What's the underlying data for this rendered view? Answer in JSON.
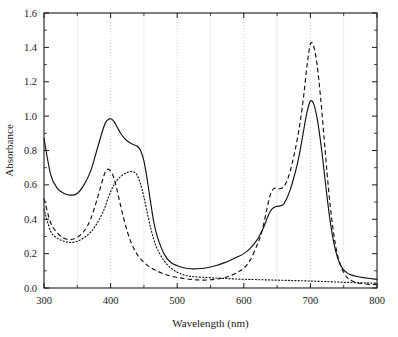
{
  "chart_data": {
    "type": "line",
    "title": "",
    "xlabel": "Wavelength (nm)",
    "ylabel": "Absorbance",
    "xlim": [
      300,
      800
    ],
    "ylim": [
      0.0,
      1.6
    ],
    "xticks": [
      300,
      400,
      500,
      600,
      700,
      800
    ],
    "xtick_labels": [
      "300",
      "400",
      "500",
      "600",
      "700",
      "800"
    ],
    "xminor_ticks": [
      350,
      450,
      550,
      650,
      750
    ],
    "yticks": [
      0.0,
      0.2,
      0.4,
      0.6,
      0.8,
      1.0,
      1.2,
      1.4,
      1.6
    ],
    "ytick_labels": [
      "0.0",
      "0.2",
      "0.4",
      "0.6",
      "0.8",
      "1.0",
      "1.2",
      "1.4",
      "1.6"
    ],
    "yminor_ticks": [
      0.1,
      0.3,
      0.5,
      0.7,
      0.9,
      1.1,
      1.3,
      1.5
    ],
    "grid": "vertical-only",
    "legend": "none",
    "x": [
      300,
      310,
      320,
      330,
      340,
      350,
      360,
      370,
      380,
      390,
      395,
      400,
      405,
      410,
      415,
      420,
      425,
      430,
      435,
      440,
      445,
      450,
      455,
      460,
      465,
      470,
      480,
      490,
      500,
      510,
      520,
      530,
      540,
      550,
      560,
      570,
      580,
      590,
      600,
      610,
      620,
      625,
      630,
      635,
      640,
      645,
      650,
      655,
      660,
      665,
      670,
      675,
      680,
      685,
      690,
      695,
      700,
      705,
      710,
      715,
      720,
      725,
      730,
      735,
      740,
      745,
      750,
      755,
      760,
      770,
      780,
      790,
      800
    ],
    "series": [
      {
        "name": "solid-curve",
        "style": "solid",
        "values": [
          0.87,
          0.66,
          0.58,
          0.55,
          0.54,
          0.55,
          0.6,
          0.68,
          0.81,
          0.94,
          0.975,
          0.985,
          0.97,
          0.935,
          0.9,
          0.875,
          0.855,
          0.842,
          0.833,
          0.825,
          0.8,
          0.74,
          0.63,
          0.5,
          0.38,
          0.3,
          0.2,
          0.15,
          0.13,
          0.118,
          0.112,
          0.112,
          0.115,
          0.122,
          0.132,
          0.146,
          0.162,
          0.18,
          0.2,
          0.232,
          0.28,
          0.315,
          0.355,
          0.405,
          0.448,
          0.468,
          0.475,
          0.478,
          0.49,
          0.525,
          0.575,
          0.64,
          0.715,
          0.81,
          0.92,
          1.025,
          1.088,
          1.07,
          0.99,
          0.86,
          0.7,
          0.53,
          0.38,
          0.265,
          0.185,
          0.135,
          0.105,
          0.088,
          0.078,
          0.067,
          0.06,
          0.055,
          0.05
        ]
      },
      {
        "name": "dashed-curve",
        "style": "dashed",
        "values": [
          0.52,
          0.38,
          0.32,
          0.29,
          0.282,
          0.295,
          0.33,
          0.4,
          0.52,
          0.655,
          0.69,
          0.68,
          0.64,
          0.565,
          0.48,
          0.4,
          0.33,
          0.272,
          0.228,
          0.195,
          0.17,
          0.15,
          0.133,
          0.119,
          0.108,
          0.098,
          0.082,
          0.07,
          0.062,
          0.055,
          0.05,
          0.047,
          0.046,
          0.048,
          0.052,
          0.06,
          0.072,
          0.09,
          0.115,
          0.165,
          0.25,
          0.3,
          0.375,
          0.465,
          0.545,
          0.578,
          0.58,
          0.578,
          0.59,
          0.625,
          0.685,
          0.765,
          0.86,
          0.975,
          1.12,
          1.295,
          1.42,
          1.405,
          1.3,
          1.12,
          0.9,
          0.67,
          0.47,
          0.315,
          0.205,
          0.135,
          0.09,
          0.062,
          0.046,
          0.03,
          0.024,
          0.021,
          0.02
        ]
      },
      {
        "name": "dotted-curve",
        "style": "dotted",
        "values": [
          0.46,
          0.33,
          0.29,
          0.272,
          0.265,
          0.272,
          0.292,
          0.325,
          0.378,
          0.455,
          0.51,
          0.56,
          0.6,
          0.628,
          0.648,
          0.662,
          0.672,
          0.678,
          0.675,
          0.655,
          0.605,
          0.53,
          0.44,
          0.352,
          0.28,
          0.228,
          0.16,
          0.118,
          0.092,
          0.076,
          0.068,
          0.064,
          0.062,
          0.06,
          0.058,
          0.056,
          0.054,
          0.052,
          0.051,
          0.05,
          0.049,
          0.048,
          0.048,
          0.047,
          0.047,
          0.046,
          0.046,
          0.045,
          0.045,
          0.044,
          0.044,
          0.043,
          0.043,
          0.042,
          0.042,
          0.041,
          0.04,
          0.04,
          0.039,
          0.038,
          0.038,
          0.037,
          0.036,
          0.035,
          0.035,
          0.034,
          0.033,
          0.033,
          0.032,
          0.031,
          0.03,
          0.029,
          0.028
        ]
      }
    ],
    "annotations": {
      "solid_main_peak": {
        "x": 700,
        "y": 1.088
      },
      "dashed_main_peak": {
        "x": 700,
        "y": 1.42
      },
      "solid_soret_peak": {
        "x": 400,
        "y": 0.985
      },
      "dashed_soret_peak": {
        "x": 395,
        "y": 0.69
      },
      "dotted_soret_peak": {
        "x": 430,
        "y": 0.678
      },
      "solid_shoulder": {
        "x": 650,
        "y": 0.475
      },
      "dashed_shoulder": {
        "x": 650,
        "y": 0.58
      }
    },
    "colors": {
      "line": "#111111",
      "frame": "#1a1a1a",
      "grid_major": "#b9b9b9",
      "grid_minor": "#e2e2e2",
      "background": "#ffffff"
    }
  }
}
